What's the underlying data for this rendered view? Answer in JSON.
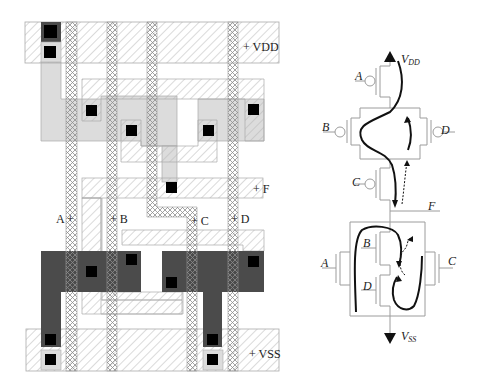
{
  "figure": {
    "layout": {
      "rails": {
        "vdd_label": "+ VDD",
        "vss_label": "+ VSS",
        "f_label": "+ F"
      },
      "inputs": {
        "a_label": "A +",
        "b_label": "+ B",
        "c_label": "+ C",
        "d_label": "+ D"
      }
    },
    "schematic": {
      "vdd_label": "V",
      "vdd_sub": "DD",
      "vss_label": "V",
      "vss_sub": "SS",
      "output_label": "F",
      "pmos_gates": [
        "A",
        "B",
        "C",
        "D"
      ],
      "nmos_gates": [
        "A",
        "B",
        "C",
        "D"
      ]
    },
    "colors": {
      "metal_hatch": "#9a9a9a",
      "poly_hatch": "#8a8a8a",
      "p_diffusion": "#d9d9d9",
      "n_diffusion": "#4a4a4a",
      "contact": "#000000",
      "wire": "#9c9c9c",
      "path": "#111111"
    }
  }
}
